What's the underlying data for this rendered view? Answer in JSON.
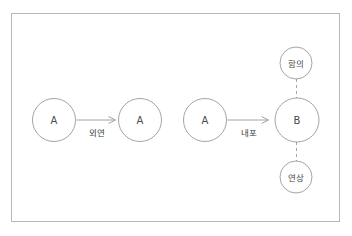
{
  "figure": {
    "frame": {
      "border_color": "#b8b8b8",
      "background_color": "#ffffff"
    },
    "stroke_color": "#9a9a9a",
    "text_color": "#4a4a4a"
  },
  "nodes": [
    {
      "id": "a1",
      "label": "A",
      "cx": 54,
      "cy": 120,
      "r": 21.5,
      "script": "latin"
    },
    {
      "id": "a2",
      "label": "A",
      "cx": 140,
      "cy": 120,
      "r": 21.5,
      "script": "latin"
    },
    {
      "id": "a3",
      "label": "A",
      "cx": 205,
      "cy": 120,
      "r": 21.5,
      "script": "latin"
    },
    {
      "id": "b1",
      "label": "B",
      "cx": 297,
      "cy": 120,
      "r": 22,
      "script": "latin"
    },
    {
      "id": "hamui",
      "label": "함의",
      "cx": 296,
      "cy": 63,
      "r": 16,
      "script": "hangul"
    },
    {
      "id": "yeonsang",
      "label": "연상",
      "cx": 296,
      "cy": 177,
      "r": 16,
      "script": "hangul"
    }
  ],
  "edges": [
    {
      "id": "edge-extension",
      "from": "a1",
      "to": "a2",
      "label": "외연",
      "style": "solid",
      "arrow": true,
      "label_x": 97,
      "label_y": 133
    },
    {
      "id": "edge-intension",
      "from": "a3",
      "to": "b1",
      "label": "내포",
      "style": "solid",
      "arrow": true,
      "label_x": 249,
      "label_y": 133
    },
    {
      "id": "edge-implication",
      "from": "b1",
      "to": "hamui",
      "label": "",
      "style": "dashed",
      "arrow": false
    },
    {
      "id": "edge-association",
      "from": "b1",
      "to": "yeonsang",
      "label": "",
      "style": "dashed",
      "arrow": false
    }
  ],
  "labels": {
    "node_a1": "A",
    "node_a2": "A",
    "node_a3": "A",
    "node_b1": "B",
    "node_hamui": "함의",
    "node_yeonsang": "연상",
    "edge_extension": "외연",
    "edge_intension": "내포"
  }
}
